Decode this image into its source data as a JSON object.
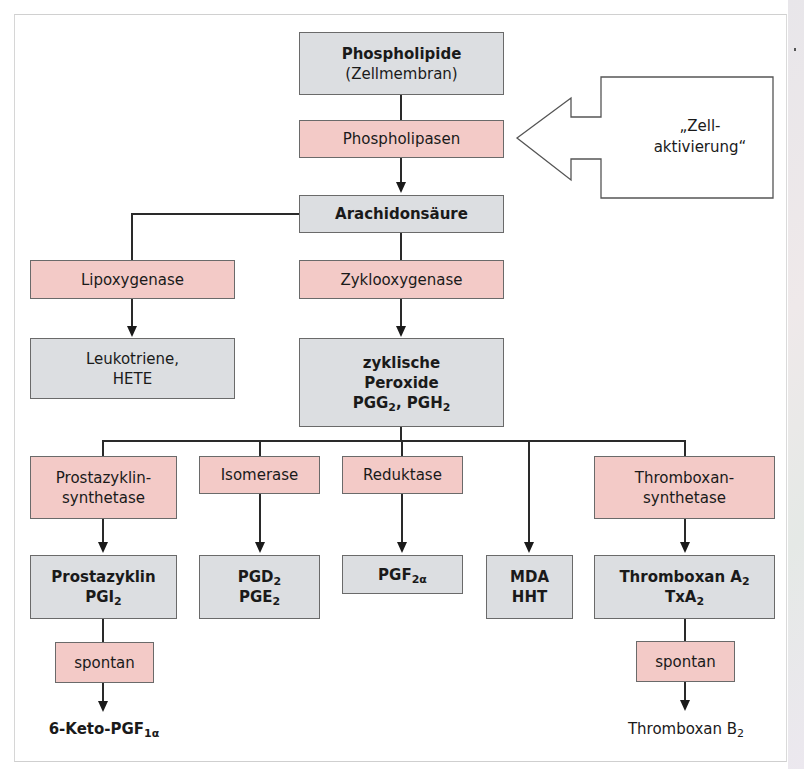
{
  "diagram": {
    "callout": {
      "line1": "„Zell-",
      "line2": "aktivierung“"
    },
    "nodes": {
      "phospholipide": {
        "line1": "Phospholipide",
        "line2": "(Zellmembran)"
      },
      "phospholipasen": {
        "label": "Phospholipasen"
      },
      "arachidonsaeure": {
        "label": "Arachidonsäure"
      },
      "lipoxygenase": {
        "label": "Lipoxygenase"
      },
      "zyklooxygenase": {
        "label": "Zyklooxygenase"
      },
      "leukotriene": {
        "line1": "Leukotriene,",
        "line2": "HETE"
      },
      "peroxide": {
        "line1": "zyklische",
        "line2": "Peroxide",
        "line3_a": "PGG",
        "line3_a_sub": "2",
        "line3_b": ", PGH",
        "line3_b_sub": "2"
      },
      "prostazyklin_synthetase": {
        "line1": "Prostazyklin-",
        "line2": "synthetase"
      },
      "isomerase": {
        "label": "Isomerase"
      },
      "reduktase": {
        "label": "Reduktase"
      },
      "thromboxan_synthetase": {
        "line1": "Thromboxan-",
        "line2": "synthetase"
      },
      "prostazyklin": {
        "line1": "Prostazyklin",
        "line2": "PGI",
        "line2_sub": "2"
      },
      "pgd_pge": {
        "line1": "PGD",
        "line1_sub": "2",
        "line2": "PGE",
        "line2_sub": "2"
      },
      "pgf": {
        "label": "PGF",
        "label_sub": "2α"
      },
      "mda_hht": {
        "line1": "MDA",
        "line2": "HHT"
      },
      "thromboxan_a2": {
        "line1": "Thromboxan A",
        "line1_sub": "2",
        "line2": "TxA",
        "line2_sub": "2"
      },
      "spontan_left": {
        "label": "spontan"
      },
      "spontan_right": {
        "label": "spontan"
      },
      "keto_pgf": {
        "label": "6-Keto-PGF",
        "label_sub": "1α"
      },
      "thromboxan_b2": {
        "label": "Thromboxan B",
        "label_sub": "2"
      }
    },
    "colors": {
      "substance_box": "#dcdee1",
      "enzyme_box": "#f3cac7",
      "border": "#6a6a6a",
      "connector": "#2a2a2a"
    }
  }
}
